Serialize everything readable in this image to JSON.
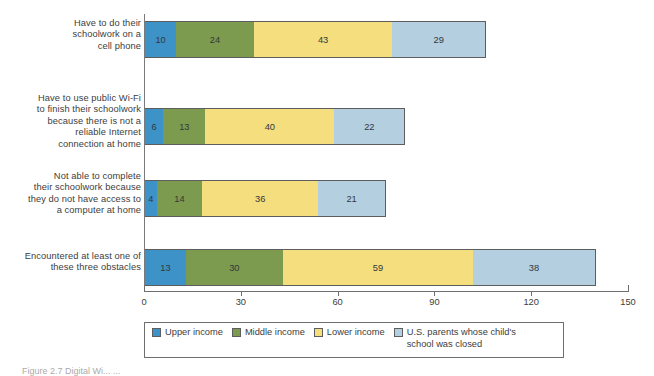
{
  "chart_data": {
    "type": "bar",
    "orientation": "horizontal",
    "stacked": true,
    "title": "",
    "xlabel": "",
    "ylabel": "",
    "xlim": [
      0,
      150
    ],
    "xticks": [
      0,
      30,
      60,
      90,
      120,
      150
    ],
    "grid": false,
    "legend_position": "bottom",
    "categories": [
      "Have to do their schoolwork on a cell phone",
      "Have to use public Wi-Fi to finish their schoolwork because there is not a reliable Internet connection at home",
      "Not able to complete their schoolwork because they do not have access to a computer at home",
      "Encountered at least one of these three obstacles"
    ],
    "series": [
      {
        "name": "Upper income",
        "color": "#3d93c8",
        "values": [
          10,
          6,
          4,
          13
        ]
      },
      {
        "name": "Middle income",
        "color": "#7d9b4e",
        "values": [
          24,
          13,
          14,
          30
        ]
      },
      {
        "name": "Lower income",
        "color": "#f5de7e",
        "values": [
          43,
          40,
          36,
          59
        ]
      },
      {
        "name": "U.S. parents whose child's school was closed",
        "color": "#b4cfe0",
        "values": [
          29,
          22,
          21,
          38
        ]
      }
    ]
  },
  "axis": {
    "tick_labels": [
      "0",
      "30",
      "60",
      "90",
      "120",
      "150"
    ]
  },
  "category_lines": [
    [
      "Have to do their",
      "schoolwork on a",
      "cell phone"
    ],
    [
      "Have to use public Wi-Fi",
      "to finish their schoolwork",
      "because there is not a",
      "reliable Internet",
      "connection at home"
    ],
    [
      "Not able to complete",
      "their schoolwork because",
      "they do not have access to",
      "a computer at home"
    ],
    [
      "Encountered at least one of",
      "these three obstacles"
    ]
  ],
  "legend": {
    "items": [
      {
        "label": "Upper income",
        "color": "#3d93c8"
      },
      {
        "label": "Middle income",
        "color": "#7d9b4e"
      },
      {
        "label": "Lower income",
        "color": "#f5de7e"
      },
      {
        "label": "U.S. parents whose child's school was closed",
        "color": "#b4cfe0"
      }
    ]
  },
  "caption": {
    "text": "Figure 2.7  Digital Wi... ..."
  }
}
